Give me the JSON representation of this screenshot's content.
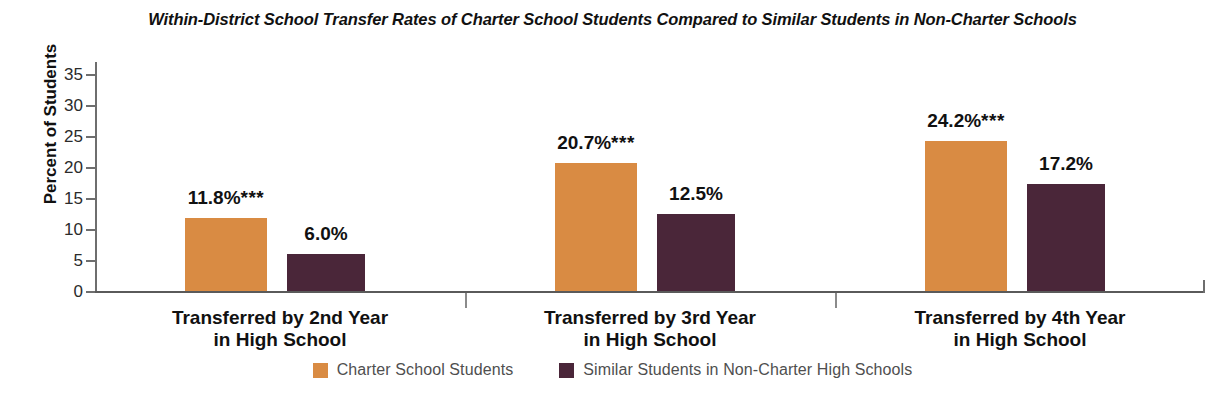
{
  "chart_data": {
    "type": "bar",
    "title": "Within-District School Transfer Rates of Charter School Students Compared to Similar Students in Non-Charter Schools",
    "xlabel": "",
    "ylabel": "Percent of Students",
    "ylim": [
      0,
      35
    ],
    "yticks": [
      0,
      5,
      10,
      15,
      20,
      25,
      30,
      35
    ],
    "ytick_labels": [
      "0",
      "5",
      "10",
      "15",
      "20",
      "25",
      "30",
      "35"
    ],
    "grid": false,
    "legend_position": "bottom-center",
    "categories": [
      "Transferred by 2nd Year\nin High School",
      "Transferred by 3rd Year\nin High School",
      "Transferred by 4th Year\nin High School"
    ],
    "category_lines": [
      [
        "Transferred by 2nd Year",
        "in High School"
      ],
      [
        "Transferred by 3rd Year",
        "in High School"
      ],
      [
        "Transferred by 4th Year",
        "in High School"
      ]
    ],
    "series": [
      {
        "name": "Charter School Students",
        "color": "#D98B43",
        "values": [
          11.8,
          20.7,
          24.2
        ],
        "data_labels": [
          "11.8%",
          "20.7%",
          "24.2%"
        ],
        "significance_marks": [
          "***",
          "***",
          "***"
        ]
      },
      {
        "name": "Similar Students in Non-Charter High Schools",
        "color": "#4A2639",
        "values": [
          6.0,
          12.5,
          17.2
        ],
        "data_labels": [
          "6.0%",
          "12.5%",
          "17.2%"
        ],
        "significance_marks": [
          "",
          "",
          ""
        ]
      }
    ]
  },
  "colors": {
    "charter": "#D98B43",
    "non_charter": "#4A2639",
    "axis": "#6e6e6e",
    "text": "#111111",
    "legend_text": "#4f4f4f"
  }
}
